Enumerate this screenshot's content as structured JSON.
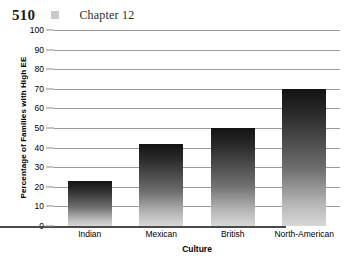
{
  "header": {
    "page_number": "510",
    "separator_icon": "gray-square-icon",
    "chapter_label": "Chapter 12"
  },
  "chart_data": {
    "type": "bar",
    "title": "",
    "categories": [
      "Indian",
      "Mexican",
      "British",
      "North-American"
    ],
    "values": [
      23,
      42,
      50,
      70
    ],
    "xlabel": "Culture",
    "ylabel": "Percentage of Families with High EE",
    "ylim": [
      0,
      100
    ],
    "ytick_labels": [
      "100",
      "90",
      "80",
      "70",
      "60",
      "50",
      "40",
      "30",
      "20",
      "10",
      "0"
    ],
    "ytick_values": [
      100,
      90,
      80,
      70,
      60,
      50,
      40,
      30,
      20,
      10,
      0
    ],
    "ytick_step": 10,
    "grid": "horizontal",
    "legend": "none",
    "bar_fill": "gradient-dark-top-to-light-bottom",
    "colors": {
      "bar_top": "#131313",
      "bar_bottom": "#d8d8d8",
      "gridline": "#9a9a9a",
      "axis": "#4a4a4a",
      "text": "#000000",
      "header_square": "#c9c9c9"
    }
  }
}
